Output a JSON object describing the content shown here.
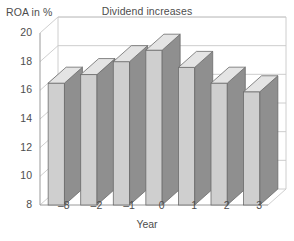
{
  "chart_data": {
    "type": "bar",
    "title": "Dividend increases",
    "xlabel": "Year",
    "ylabel": "ROA in %",
    "categories": [
      "–8",
      "–2",
      "–1",
      "0",
      "1",
      "2",
      "3"
    ],
    "values": [
      16.5,
      17.1,
      18.0,
      18.8,
      17.6,
      16.5,
      15.9
    ],
    "ylim": [
      8,
      20
    ],
    "yticks": [
      20,
      18,
      16,
      14,
      12,
      10,
      8
    ],
    "grid": true,
    "legend": false,
    "style": "3d-column",
    "series": [
      {
        "name": "ROA in %",
        "values": [
          16.5,
          17.1,
          18.0,
          18.8,
          17.6,
          16.5,
          15.9
        ]
      }
    ]
  },
  "colors": {
    "bar_front": "#cfcfcf",
    "bar_side": "#8f8f8f",
    "bar_top": "#e4e4e4",
    "bar_outline": "#6b6b6b",
    "grid": "#c8c8c8",
    "axis": "#9a9a9a",
    "text": "#4d4d4d",
    "background": "#ffffff"
  }
}
